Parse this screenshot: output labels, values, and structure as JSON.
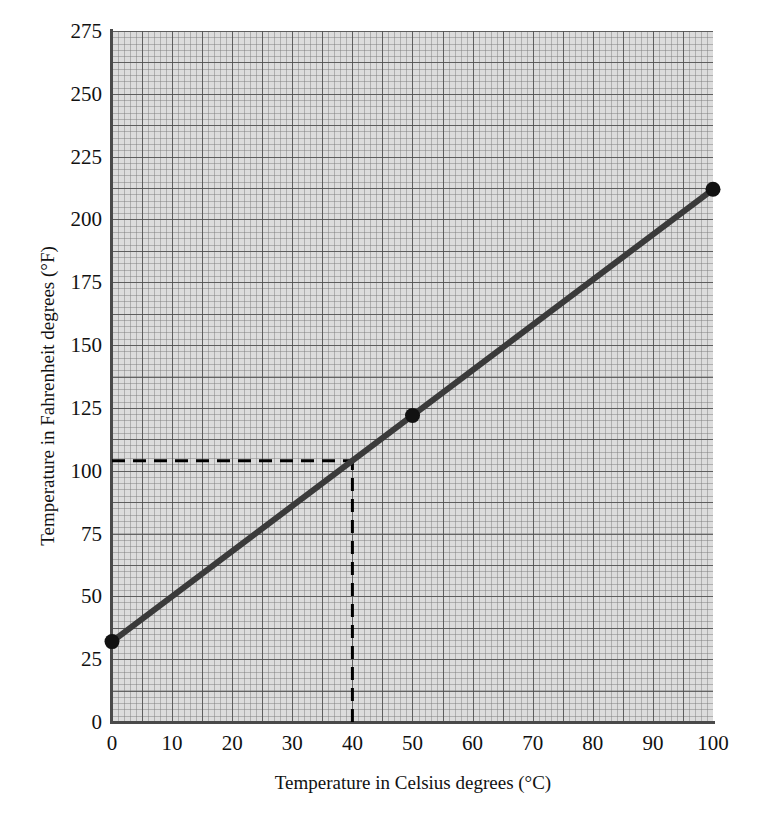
{
  "chart_data": {
    "type": "line",
    "title": "",
    "xlabel": "Temperature in Celsius degrees (°C)",
    "ylabel": "Temperature in Fahrenheit degrees (°F)",
    "xlim": [
      0,
      100
    ],
    "ylim": [
      0,
      275
    ],
    "xticks": [
      0,
      10,
      20,
      30,
      40,
      50,
      60,
      70,
      80,
      90,
      100
    ],
    "yticks": [
      0,
      25,
      50,
      75,
      100,
      125,
      150,
      175,
      200,
      225,
      250,
      275
    ],
    "xtick_labels": [
      "0",
      "10",
      "20",
      "30",
      "40",
      "50",
      "60",
      "70",
      "80",
      "90",
      "100"
    ],
    "ytick_labels": [
      "0",
      "25",
      "50",
      "75",
      "100",
      "125",
      "150",
      "175",
      "200",
      "225",
      "250",
      "275"
    ],
    "grid": "graph-paper minor and major",
    "legend": "none",
    "series": [
      {
        "name": "Celsius to Fahrenheit conversion",
        "x": [
          0,
          100
        ],
        "values": [
          32,
          212
        ],
        "color": "#3a3a3a",
        "line_width": 6
      }
    ],
    "markers": [
      {
        "label": "freezing point",
        "x": 0,
        "y": 32
      },
      {
        "label": "midpoint",
        "x": 50,
        "y": 122
      },
      {
        "label": "boiling point",
        "x": 100,
        "y": 212
      }
    ],
    "annotations": [
      {
        "name": "guide-line-vertical",
        "style": "dashed",
        "x": 40,
        "y_from": 0,
        "y_to": 104,
        "color": "#000000"
      },
      {
        "name": "guide-line-horizontal",
        "style": "dashed",
        "y": 104,
        "x_from": 0,
        "x_to": 40,
        "color": "#000000"
      }
    ],
    "colors": {
      "plot_background": "#dcdcdc",
      "minor_grid": "#787878",
      "major_grid": "#505050",
      "axis": "#4a4a4a",
      "series": "#3a3a3a",
      "annotation": "#000000",
      "text": "#111111",
      "page_background": "#ffffff"
    }
  }
}
